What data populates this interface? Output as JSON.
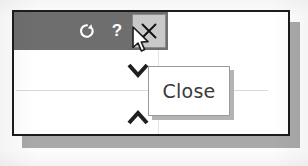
{
  "window": {
    "title_bar": {
      "background_color": "#6e6e6e",
      "buttons": [
        {
          "name": "refresh-icon",
          "label": "↻",
          "tooltip": ""
        },
        {
          "name": "help-icon",
          "label": "?",
          "tooltip": ""
        },
        {
          "name": "close-icon",
          "label": "✕",
          "tooltip": "Close",
          "state": "hovered",
          "highlight_color": "#c9c9c9"
        }
      ]
    },
    "content": {
      "chevron_down": "⌄",
      "chevron_up": "⌃",
      "divider": "",
      "vertical_rule": ""
    },
    "border_color": "#1c1c1c",
    "shadow_color": "#a9a9a9",
    "background_color": "#ffffff"
  },
  "tooltip": {
    "text": "Close",
    "background_color": "#ffffff",
    "border_color": "#9a9a9a",
    "text_color": "#3a3a3a"
  },
  "cursor": {
    "type": "arrow-pointer",
    "x": 131,
    "y": 26
  }
}
